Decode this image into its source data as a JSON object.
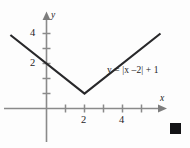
{
  "figure": {
    "equation_label": "y = |x –2| + 1",
    "end_marker": "black-square"
  },
  "axes": {
    "x_name": "x",
    "y_name": "y",
    "x_tick_labels": [
      "2",
      "4"
    ],
    "y_tick_labels": [
      "4",
      "2"
    ]
  },
  "chart_data": {
    "type": "line",
    "title": "",
    "subtitle": "",
    "xlabel": "x",
    "ylabel": "y",
    "equation": "y = |x - 2| + 1",
    "function": "absolute_value",
    "vertex": [
      2,
      1
    ],
    "slope_left": -1,
    "slope_right": 1,
    "x": [
      -1.9,
      2,
      6.0
    ],
    "y": [
      4.9,
      1,
      5.0
    ],
    "series": [
      {
        "name": "y = |x –2| + 1",
        "points": [
          [
            -1.9,
            4.9
          ],
          [
            2,
            1
          ],
          [
            6.0,
            5.0
          ]
        ]
      }
    ],
    "xlim": [
      -2.3,
      6.8
    ],
    "ylim": [
      -2.3,
      5.9
    ],
    "xticks": [
      1,
      2,
      3,
      4,
      5
    ],
    "yticks": [
      1,
      2,
      3,
      4
    ],
    "xtick_labels": {
      "2": "2",
      "4": "4"
    },
    "ytick_labels": {
      "2": "2",
      "4": "4"
    },
    "grid": false,
    "legend": false,
    "annotations": [
      {
        "text": "y = |x –2| + 1",
        "x": 3.3,
        "y": 2.45
      }
    ],
    "axis_color": "#8a8a8a",
    "curve_color": "#28282a",
    "background": "#fdfdfd"
  }
}
